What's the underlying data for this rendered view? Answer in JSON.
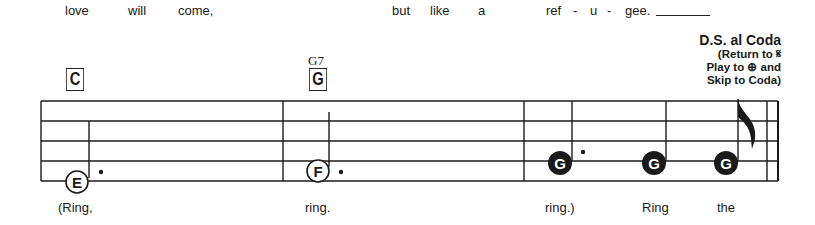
{
  "lyrics_top": [
    {
      "text": "love",
      "x": 65
    },
    {
      "text": "will",
      "x": 128
    },
    {
      "text": "come,",
      "x": 178
    },
    {
      "text": "but",
      "x": 392
    },
    {
      "text": "like",
      "x": 430
    },
    {
      "text": "a",
      "x": 478
    },
    {
      "text": "ref",
      "x": 546
    },
    {
      "text": "-",
      "x": 573
    },
    {
      "text": "u",
      "x": 590
    },
    {
      "text": "-",
      "x": 607
    },
    {
      "text": "gee.",
      "x": 625
    }
  ],
  "lyrics_bottom": [
    {
      "text": "(Ring,",
      "x": 58
    },
    {
      "text": "ring.",
      "x": 305
    },
    {
      "text": "ring.)",
      "x": 545
    },
    {
      "text": "Ring",
      "x": 642
    },
    {
      "text": "the",
      "x": 717
    }
  ],
  "chords": [
    {
      "symbol": "C",
      "x": 64,
      "alt": ""
    },
    {
      "symbol": "G",
      "x": 307,
      "alt": "G7"
    }
  ],
  "ds_al_coda": {
    "title": "D.S. al Coda",
    "line1": "(Return to 𝄋",
    "line2": "Play to ⊕ and",
    "line3": "Skip to Coda)"
  },
  "notes": [
    {
      "letter": "E",
      "x": 77,
      "y": 182,
      "filled": false,
      "dotted": true
    },
    {
      "letter": "F",
      "x": 318,
      "y": 171,
      "filled": false,
      "dotted": true
    },
    {
      "letter": "G",
      "x": 560,
      "y": 163,
      "filled": true,
      "dotted": true
    },
    {
      "letter": "G",
      "x": 654,
      "y": 163,
      "filled": true,
      "dotted": false
    },
    {
      "letter": "G",
      "x": 726,
      "y": 163,
      "filled": true,
      "dotted": false,
      "flag": true
    }
  ],
  "colors": {
    "ink": "#1a1a1a",
    "background": "#ffffff"
  }
}
